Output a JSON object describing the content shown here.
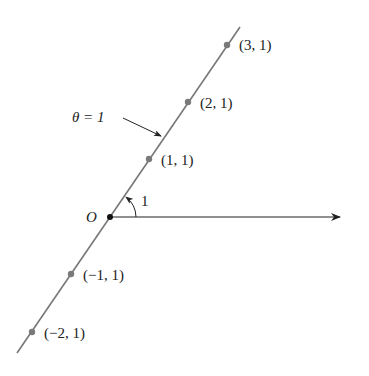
{
  "diagram": {
    "line_label": "θ = 1",
    "origin_label": "O",
    "angle_label": "1",
    "colors": {
      "line": "#777777",
      "point": "#7a7a7a",
      "origin": "#111111",
      "text": "#222222",
      "axis": "#222222"
    },
    "points": [
      {
        "label": "(3, 1)",
        "x": 227,
        "y": 45
      },
      {
        "label": "(2, 1)",
        "x": 188,
        "y": 102
      },
      {
        "label": "(1, 1)",
        "x": 149,
        "y": 159
      },
      {
        "label": "(−1, 1)",
        "x": 71,
        "y": 274
      },
      {
        "label": "(−2, 1)",
        "x": 32,
        "y": 332
      }
    ]
  }
}
